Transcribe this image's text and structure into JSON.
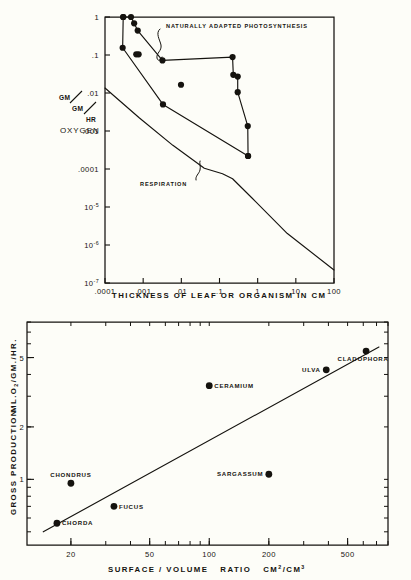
{
  "figure": {
    "background_color": "#fdfdf8",
    "ink_color": "#15130f"
  },
  "chart_data": [
    {
      "type": "line",
      "id": "top-panel",
      "title": "",
      "xlabel": "THICKNESS OF LEAF OR ORGANISM IN CM",
      "ylabel": "OXYGEN",
      "y_unit_label": "GM/GM/HR",
      "xscale": "log",
      "yscale": "log",
      "xlim": [
        0.0001,
        100
      ],
      "ylim": [
        1e-07,
        1
      ],
      "grid": false,
      "legend_position": "none",
      "xtick_labels": [
        ".0001",
        ".001",
        ".01",
        ".1",
        "1",
        "10",
        "100"
      ],
      "xtick_values": [
        0.0001,
        0.001,
        0.01,
        0.1,
        1,
        10,
        100
      ],
      "ytick_labels": [
        "1",
        ".1",
        ".01",
        ".001",
        ".0001",
        "10^-5",
        "10^-6",
        "10^-7"
      ],
      "ytick_values": [
        1,
        0.1,
        0.01,
        0.001,
        0.0001,
        1e-05,
        1e-06,
        1e-07
      ],
      "annotations": [
        {
          "text": "NATURALLY ADAPTED PHOTOSYNTHESIS",
          "x": 0.012,
          "y": 0.33
        },
        {
          "text": "RESPIRATION",
          "x": 0.05,
          "y": 1.05e-05
        }
      ],
      "series": [
        {
          "name": "photosynthesis-envelope",
          "marker": "filled-circle",
          "line": true,
          "points": [
            {
              "x": 0.0003,
              "y": 1.0
            },
            {
              "x": 0.00048,
              "y": 1.0
            },
            {
              "x": 0.00058,
              "y": 0.68
            },
            {
              "x": 0.00072,
              "y": 0.44
            },
            {
              "x": 0.0032,
              "y": 0.072
            },
            {
              "x": 0.22,
              "y": 0.088
            },
            {
              "x": 0.23,
              "y": 0.03
            },
            {
              "x": 0.3,
              "y": 0.027
            },
            {
              "x": 0.3,
              "y": 0.0105
            },
            {
              "x": 0.55,
              "y": 0.00135
            },
            {
              "x": 0.56,
              "y": 0.00022
            }
          ]
        },
        {
          "name": "photosynthesis-lower-envelope",
          "marker": "filled-circle",
          "line": true,
          "points": [
            {
              "x": 0.0003,
              "y": 1.0
            },
            {
              "x": 0.00029,
              "y": 0.155
            },
            {
              "x": 0.0033,
              "y": 0.005
            },
            {
              "x": 0.56,
              "y": 0.00022
            }
          ]
        },
        {
          "name": "interior-points",
          "marker": "filled-circle",
          "line": false,
          "points": [
            {
              "x": 0.00066,
              "y": 0.104
            },
            {
              "x": 0.00076,
              "y": 0.104
            },
            {
              "x": 0.0098,
              "y": 0.0165
            }
          ]
        },
        {
          "name": "respiration",
          "marker": "none",
          "line": true,
          "points": [
            {
              "x": 0.0001,
              "y": 0.0135
            },
            {
              "x": 0.0008,
              "y": 0.0022
            },
            {
              "x": 0.006,
              "y": 0.00042
            },
            {
              "x": 0.04,
              "y": 0.000105
            },
            {
              "x": 0.12,
              "y": 7.5e-05
            },
            {
              "x": 0.22,
              "y": 5.55e-05
            },
            {
              "x": 0.7,
              "y": 1.75e-05
            },
            {
              "x": 6,
              "y": 2e-06
            },
            {
              "x": 100,
              "y": 2.2e-07
            }
          ]
        }
      ]
    },
    {
      "type": "scatter",
      "id": "bottom-panel",
      "title": "",
      "xlabel": "SURFACE / VOLUME    RATIO    CM2/CM3",
      "xlabel_parts": [
        "SURFACE / VOLUME",
        "RATIO",
        "CM",
        "2",
        "/CM",
        "3"
      ],
      "ylabel": "GROSS PRODUCTION",
      "ylabel_unit": "ML.O2 /GM./HR.",
      "xscale": "log",
      "yscale": "log",
      "xlim": [
        12,
        800
      ],
      "ylim": [
        0.42,
        8.0
      ],
      "grid": false,
      "legend_position": "none",
      "xtick_labels": [
        "20",
        "50",
        "100",
        "200",
        "500"
      ],
      "xtick_values": [
        20,
        50,
        100,
        200,
        500
      ],
      "ytick_labels": [
        "1",
        "2",
        "5"
      ],
      "ytick_values": [
        1,
        2,
        5
      ],
      "points": [
        {
          "label": "CHORDA",
          "x": 17,
          "y": 0.56,
          "label_side": "right"
        },
        {
          "label": "CHONDRUS",
          "x": 20,
          "y": 0.95,
          "label_side": "above"
        },
        {
          "label": "FUCUS",
          "x": 33,
          "y": 0.7,
          "label_side": "right"
        },
        {
          "label": "CERAMIUM",
          "x": 100,
          "y": 3.45,
          "label_side": "right"
        },
        {
          "label": "SARGASSUM",
          "x": 200,
          "y": 1.07,
          "label_side": "left"
        },
        {
          "label": "ULVA",
          "x": 390,
          "y": 4.25,
          "label_side": "left"
        },
        {
          "label": "CLADOPHORA",
          "x": 620,
          "y": 5.45,
          "label_side": "below"
        }
      ],
      "fit_line": {
        "name": "regression-line",
        "x_start": 14.5,
        "y_start": 0.5,
        "x_end": 720,
        "y_end": 5.75
      }
    }
  ]
}
